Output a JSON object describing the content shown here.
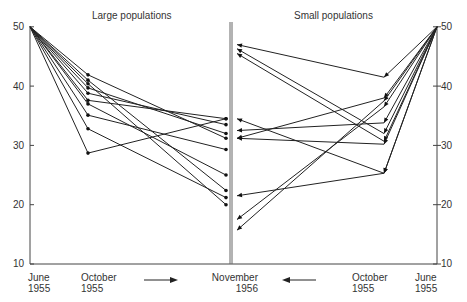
{
  "chart_data": [
    {
      "type": "line",
      "title": "Large populations",
      "x": [
        "June 1955",
        "October 1955",
        "November 1956"
      ],
      "ylabel": "",
      "ylim": [
        10,
        50
      ],
      "yticks": [
        10,
        20,
        30,
        40,
        50
      ],
      "grid": false,
      "series": [
        {
          "name": "L1",
          "values": [
            50,
            41.9,
            31.2
          ]
        },
        {
          "name": "L2",
          "values": [
            50,
            41.0,
            22.4
          ]
        },
        {
          "name": "L3",
          "values": [
            50,
            40.4,
            20.0
          ]
        },
        {
          "name": "L4",
          "values": [
            50,
            39.7,
            32.0
          ]
        },
        {
          "name": "L5",
          "values": [
            50,
            38.8,
            33.5
          ]
        },
        {
          "name": "L6",
          "values": [
            50,
            37.6,
            34.5
          ]
        },
        {
          "name": "L7",
          "values": [
            50,
            37.0,
            25.0
          ]
        },
        {
          "name": "L8",
          "values": [
            50,
            35.1,
            29.3
          ]
        },
        {
          "name": "L9",
          "values": [
            50,
            32.8,
            21.2
          ]
        },
        {
          "name": "L10",
          "values": [
            50,
            28.7,
            34.5
          ]
        }
      ]
    },
    {
      "type": "line",
      "title": "Small populations",
      "x": [
        "June 1955",
        "October 1955",
        "November 1956"
      ],
      "ylim": [
        10,
        50
      ],
      "yticks": [
        10,
        20,
        30,
        40,
        50
      ],
      "grid": false,
      "series": [
        {
          "name": "S1",
          "values": [
            50,
            41.5,
            47.0
          ]
        },
        {
          "name": "S2",
          "values": [
            50,
            38.0,
            31.2
          ]
        },
        {
          "name": "S3",
          "values": [
            50,
            36.5,
            17.5
          ]
        },
        {
          "name": "S4",
          "values": [
            50,
            33.8,
            32.5
          ]
        },
        {
          "name": "S5",
          "values": [
            50,
            32.0,
            46.3
          ]
        },
        {
          "name": "S6",
          "values": [
            50,
            30.7,
            45.5
          ]
        },
        {
          "name": "S7",
          "values": [
            50,
            30.2,
            31.2
          ]
        },
        {
          "name": "S8",
          "values": [
            50,
            25.3,
            34.5
          ]
        },
        {
          "name": "S9",
          "values": [
            50,
            25.3,
            21.5
          ]
        },
        {
          "name": "S10",
          "values": [
            50,
            37.5,
            15.7
          ]
        }
      ]
    }
  ],
  "labels": {
    "left_title": "Large populations",
    "right_title": "Small populations",
    "x_june_left": [
      "June",
      "1955"
    ],
    "x_oct_left": [
      "October",
      "1955"
    ],
    "x_nov": [
      "November",
      "1956"
    ],
    "x_oct_right": [
      "October",
      "1955"
    ],
    "x_june_right": [
      "June",
      "1955"
    ],
    "yticks": [
      "50",
      "40",
      "30",
      "20",
      "10"
    ]
  }
}
